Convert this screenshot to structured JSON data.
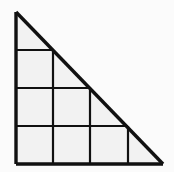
{
  "figure": {
    "kind": "geometry-diagram",
    "shape_name": "right-triangle-with-grid",
    "background_color": "#fbfbfb",
    "stroke_color": "#111111",
    "fill_color": "#f2f2f2",
    "outline_stroke_width": 3.4,
    "grid_stroke_width": 2.2,
    "canvas": {
      "width": 174,
      "height": 172
    },
    "triangle": {
      "apex": {
        "x": 16,
        "y": 12
      },
      "bottom_left": {
        "x": 16,
        "y": 164
      },
      "bottom_right": {
        "x": 163,
        "y": 164
      },
      "leg_vertical_length": 152,
      "leg_horizontal_length": 147
    },
    "grid": {
      "cell_width": 37.5,
      "cell_height": 38,
      "columns": 4,
      "rows": 4,
      "horizontal_lines": [
        {
          "y": 50,
          "x_start": 16,
          "x_end": 53
        },
        {
          "y": 88,
          "x_start": 16,
          "x_end": 91
        },
        {
          "y": 126,
          "x_start": 16,
          "x_end": 128
        }
      ],
      "vertical_lines": [
        {
          "x": 53,
          "y_start": 50,
          "y_end": 164
        },
        {
          "x": 90,
          "y_start": 88,
          "y_end": 164
        },
        {
          "x": 128,
          "y_start": 126,
          "y_end": 164
        }
      ]
    }
  }
}
